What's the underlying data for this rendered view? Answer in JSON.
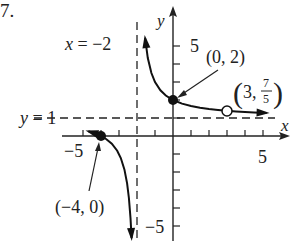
{
  "problem_number": "7.",
  "chart_data": {
    "type": "line",
    "title": "",
    "function_description": "Rational function with vertical asymptote x = -2, horizontal asymptote y = 1, hole at (3, 7/5)",
    "xlabel": "x",
    "ylabel": "y",
    "xlim": [
      -6,
      6
    ],
    "ylim": [
      -6,
      6
    ],
    "x_tick_labels": [
      {
        "value": -5,
        "label": "-5"
      },
      {
        "value": 5,
        "label": "5"
      }
    ],
    "y_tick_labels": [
      {
        "value": 5,
        "label": "5"
      },
      {
        "value": -5,
        "label": "-5"
      }
    ],
    "asymptotes": [
      {
        "type": "vertical",
        "value": -2,
        "label": "x = -2"
      },
      {
        "type": "horizontal",
        "value": 1,
        "label": "y = 1"
      }
    ],
    "points": [
      {
        "x": 0,
        "y": 2,
        "label": "(0, 2)",
        "style": "filled"
      },
      {
        "x": -4,
        "y": 0,
        "label": "(-4, 0)",
        "style": "filled"
      },
      {
        "x": 3,
        "y": 1.4,
        "label": "(3, 7/5)",
        "style": "open"
      }
    ],
    "series": [
      {
        "name": "right-branch",
        "x": [
          -1.55,
          -1.4,
          -1.2,
          -1.0,
          -0.7,
          -0.4,
          0,
          0.5,
          1,
          1.5,
          2,
          2.5,
          3,
          3.5,
          4,
          4.5,
          5.2
        ],
        "y": [
          5.44,
          4.33,
          3.5,
          3.0,
          2.54,
          2.25,
          2.0,
          1.8,
          1.667,
          1.571,
          1.5,
          1.444,
          1.4,
          1.364,
          1.333,
          1.308,
          1.278
        ]
      },
      {
        "name": "left-branch",
        "x": [
          -4.7,
          -4.5,
          -4.2,
          -4.0,
          -3.7,
          -3.4,
          -3.1,
          -2.9,
          -2.7,
          -2.55,
          -2.45,
          -2.36,
          -2.3
        ],
        "y": [
          0.259,
          0.2,
          0.091,
          0.0,
          -0.176,
          -0.429,
          -0.818,
          -1.222,
          -1.857,
          -2.636,
          -3.444,
          -4.556,
          -5.667
        ]
      }
    ]
  },
  "labels": {
    "vasym": "x = −2",
    "hasym": "y = 1",
    "y_axis": "y",
    "x_axis": "x",
    "tick_y5": "5",
    "tick_yneg5": "−5",
    "tick_x5": "5",
    "tick_xneg5": "−5",
    "pt_0_2": "(0, 2)",
    "pt_neg4_0": "(−4, 0)",
    "pt_3_open": "(3, ",
    "frac_num": "7",
    "frac_den": "5",
    "pt_3_close": ")"
  }
}
